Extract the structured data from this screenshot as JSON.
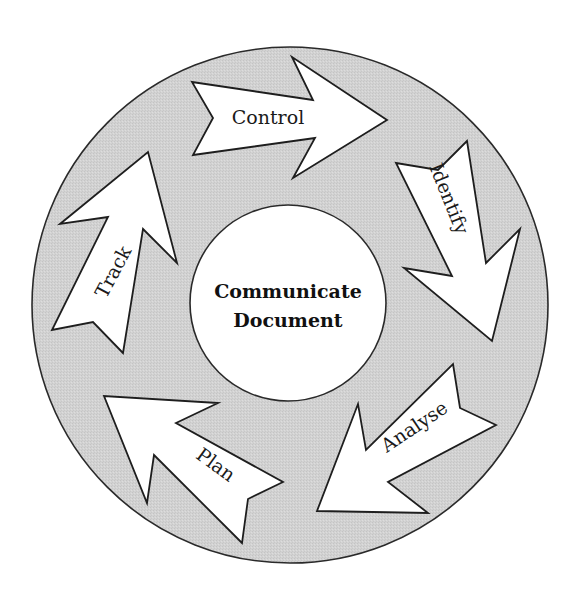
{
  "diagram": {
    "center": {
      "line1": "Communicate",
      "line2": "Document"
    },
    "steps": [
      {
        "label": "Control"
      },
      {
        "label": "Identify"
      },
      {
        "label": "Analyse"
      },
      {
        "label": "Plan"
      },
      {
        "label": "Track"
      }
    ],
    "colors": {
      "ring_fill": "#d4d4d4",
      "arrow_fill": "#ffffff",
      "outline": "#1e1e1e",
      "background": "#ffffff"
    }
  }
}
